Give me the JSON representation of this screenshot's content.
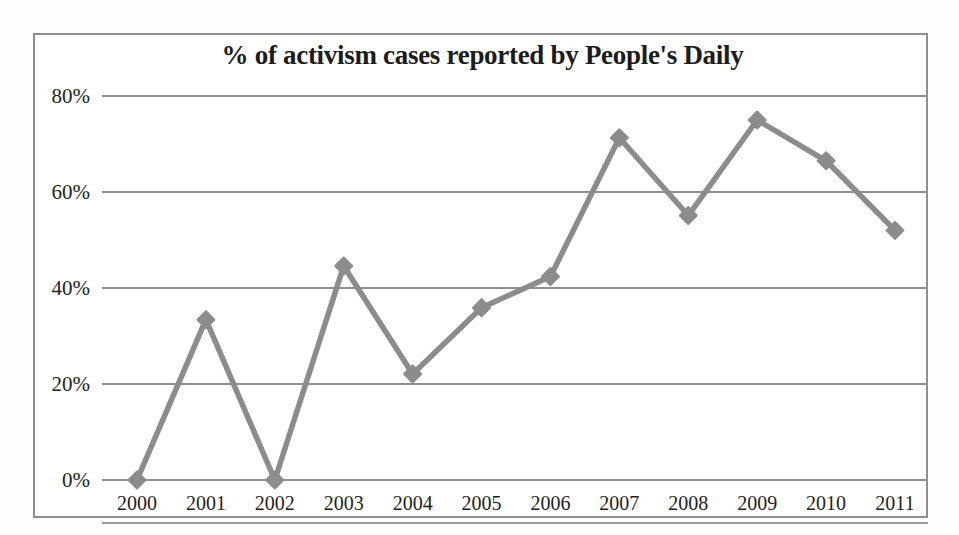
{
  "chart_data": {
    "type": "line",
    "title": "% of activism cases reported by People's Daily",
    "xlabel": "",
    "ylabel": "",
    "categories": [
      "2000",
      "2001",
      "2002",
      "2003",
      "2004",
      "2005",
      "2006",
      "2007",
      "2008",
      "2009",
      "2010",
      "2011"
    ],
    "values": [
      0,
      33.4,
      0,
      44.6,
      22.1,
      35.9,
      42.4,
      71.3,
      55.1,
      75.0,
      66.5,
      52.0
    ],
    "series": [
      {
        "name": "% of activism cases reported by People's Daily",
        "values": [
          0,
          33.4,
          0,
          44.6,
          22.1,
          35.9,
          42.4,
          71.3,
          55.1,
          75.0,
          66.5,
          52.0
        ]
      }
    ],
    "ylim": [
      0,
      80
    ],
    "ytick_values": [
      0,
      20,
      40,
      60,
      80
    ],
    "ytick_labels": [
      "0%",
      "20%",
      "40%",
      "60%",
      "80%"
    ],
    "grid": true,
    "grid_axis": "y",
    "legend": false,
    "legend_position": "none",
    "marker": "diamond",
    "line_color": "#8c8c8c",
    "marker_color": "#8c8c8c",
    "grid_color": "#8f8f8f",
    "title_color": "#1c1c1c",
    "background_color": "#ffffff",
    "border_color": "#8e8e8e"
  }
}
